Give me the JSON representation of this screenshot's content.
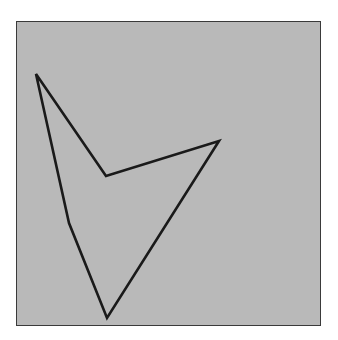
{
  "figure": {
    "background_color": "#b9b9b9",
    "border_color": "#3a3a3a",
    "panel": {
      "x": 16,
      "y": 21,
      "width": 305,
      "height": 305
    },
    "polygon": {
      "stroke_color": "#1a1a1a",
      "stroke_width": 2.6,
      "fill": "none",
      "vertices": [
        [
          36,
          74
        ],
        [
          106,
          176
        ],
        [
          219,
          141
        ],
        [
          107,
          318
        ],
        [
          69,
          223
        ]
      ]
    }
  }
}
